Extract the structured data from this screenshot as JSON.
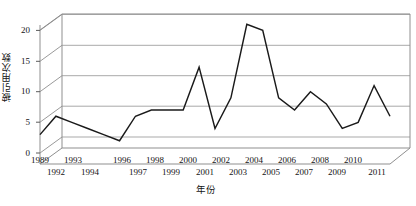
{
  "chart_data": {
    "type": "line",
    "title": "",
    "xlabel": "年份",
    "ylabel": "被引用次数",
    "x": [
      1989,
      1990,
      1991,
      1992,
      1993,
      1994,
      1995,
      1996,
      1997,
      1998,
      1999,
      2000,
      2001,
      2002,
      2003,
      2004,
      2005,
      2006,
      2007,
      2008,
      2009,
      2010,
      2011
    ],
    "values": [
      3,
      6,
      5,
      4,
      3,
      2,
      6,
      7,
      7,
      7,
      14,
      4,
      9,
      21,
      20,
      9,
      7,
      10,
      8,
      4,
      5,
      11,
      6
    ],
    "series": [
      {
        "name": "被引用次数",
        "values": [
          3,
          6,
          5,
          4,
          3,
          2,
          6,
          7,
          7,
          7,
          14,
          4,
          9,
          21,
          20,
          9,
          7,
          10,
          8,
          4,
          5,
          11,
          6
        ]
      }
    ],
    "ylim": [
      0,
      22
    ],
    "yticks": [
      0,
      5,
      10,
      15,
      20
    ],
    "ytick_labels": [
      "0",
      "5",
      "10",
      "15",
      "20"
    ],
    "xtick_labels_top": [
      "1989",
      "1993",
      "1996",
      "1998",
      "2000",
      "2002",
      "2004",
      "2006",
      "2008",
      "2010"
    ],
    "xtick_labels_bottom": [
      "1992",
      "1994",
      "1997",
      "1999",
      "2001",
      "2003",
      "2005",
      "2007",
      "2009",
      "2011"
    ],
    "grid": true,
    "gridlines_at": [
      5,
      10,
      15,
      20
    ],
    "legend": "none",
    "style": "3d-perspective-line",
    "line_color": "#1a1a1a",
    "grid_color": "#a8a8a8",
    "axis_color": "#8a8a8a"
  },
  "axes": {
    "y_title": "被引用次数",
    "x_title": "年份",
    "y_ticks": [
      {
        "label": "20"
      },
      {
        "label": "15"
      },
      {
        "label": "10"
      },
      {
        "label": "5"
      },
      {
        "label": "0"
      }
    ],
    "x_ticks": [
      {
        "label": "1989",
        "row": "top"
      },
      {
        "label": "1992",
        "row": "bottom"
      },
      {
        "label": "1993",
        "row": "top"
      },
      {
        "label": "1994",
        "row": "bottom"
      },
      {
        "label": "1996",
        "row": "top"
      },
      {
        "label": "1997",
        "row": "bottom"
      },
      {
        "label": "1998",
        "row": "top"
      },
      {
        "label": "1999",
        "row": "bottom"
      },
      {
        "label": "2000",
        "row": "top"
      },
      {
        "label": "2001",
        "row": "bottom"
      },
      {
        "label": "2002",
        "row": "top"
      },
      {
        "label": "2003",
        "row": "bottom"
      },
      {
        "label": "2004",
        "row": "top"
      },
      {
        "label": "2005",
        "row": "bottom"
      },
      {
        "label": "2006",
        "row": "top"
      },
      {
        "label": "2007",
        "row": "bottom"
      },
      {
        "label": "2008",
        "row": "top"
      },
      {
        "label": "2009",
        "row": "bottom"
      },
      {
        "label": "2010",
        "row": "top"
      },
      {
        "label": "2011",
        "row": "bottom"
      }
    ]
  }
}
